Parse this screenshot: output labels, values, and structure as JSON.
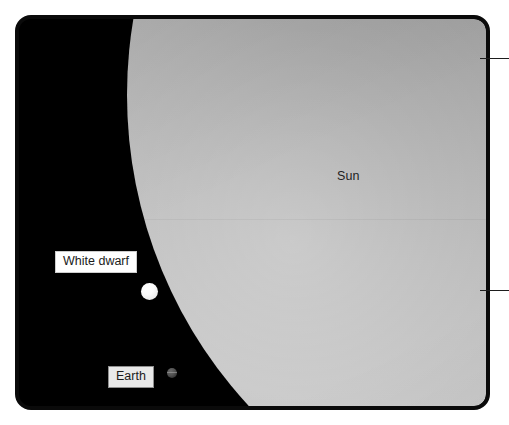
{
  "figure": {
    "background_color": "#ffffff",
    "panel": {
      "border_color": "#0a0a0a",
      "space_color": "#000000",
      "corner_radius_px": 16
    }
  },
  "bodies": [
    {
      "id": "sun",
      "label": "Sun",
      "label_style": "plain",
      "color": "#b4b4b4",
      "relative_size": "giant",
      "description": "Large gradient sphere filling the upper-right of the frame"
    },
    {
      "id": "white-dwarf",
      "label": "White dwarf",
      "label_style": "boxed-white",
      "color": "#ffffff",
      "relative_size": "small",
      "description": "Small bright white sphere in the black field at left"
    },
    {
      "id": "earth",
      "label": "Earth",
      "label_style": "boxed-gray",
      "color": "#4d4d4d",
      "relative_size": "tiny",
      "description": "Very small dark sphere near the bottom left"
    }
  ],
  "labels": {
    "sun": "Sun",
    "white_dwarf": "White dwarf",
    "earth": "Earth"
  },
  "leaders": [
    {
      "id": "leader-top",
      "y": 58,
      "color": "#1d1d1d"
    },
    {
      "id": "leader-bottom",
      "y": 290,
      "color": "#1d1d1d"
    }
  ]
}
